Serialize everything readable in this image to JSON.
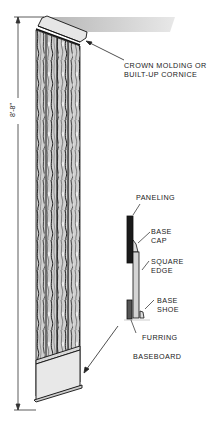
{
  "diagram": {
    "dimension": {
      "label": "8'-8\"",
      "orientation": "vertical"
    },
    "callouts": {
      "crown": {
        "line1": "CROWN MOLDING OR",
        "line2": "BUILT-UP CORNICE"
      },
      "paneling": "PANELING",
      "base_cap": {
        "line1": "BASE",
        "line2": "CAP"
      },
      "square_edge": {
        "line1": "SQUARE",
        "line2": "EDGE"
      },
      "base_shoe": {
        "line1": "BASE",
        "line2": "SHOE"
      },
      "furring": "FURRING",
      "baseboard": "BASEBOARD"
    },
    "colors": {
      "ink": "#1a1a1a",
      "ceiling_shade": "#c8c8c8",
      "molding_fill": "#e6e6e6",
      "wood_grain_dark": "#3a3a3a",
      "wood_grain_light": "#bdbdbd"
    }
  }
}
